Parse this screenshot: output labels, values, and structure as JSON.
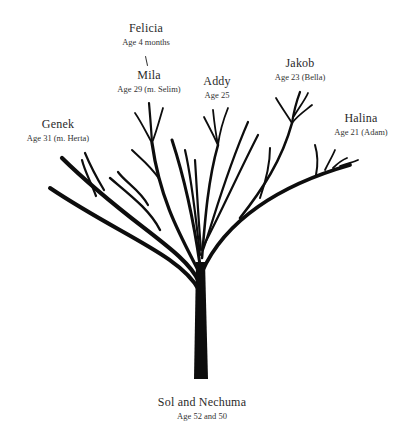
{
  "diagram": {
    "type": "family-tree",
    "trunk_color": "#0d0d0d",
    "background": "#ffffff",
    "root": {
      "name": "Sol and Nechuma",
      "age": "Age 52 and 50"
    },
    "children": [
      {
        "name": "Genek",
        "age": "Age 31 (m. Herta)"
      },
      {
        "name": "Mila",
        "age": "Age 29 (m. Selim)",
        "children": [
          {
            "name": "Felicia",
            "age": "Age 4 months"
          }
        ]
      },
      {
        "name": "Addy",
        "age": "Age 25"
      },
      {
        "name": "Jakob",
        "age": "Age 23 (Bella)"
      },
      {
        "name": "Halina",
        "age": "Age 21 (Adam)"
      }
    ]
  },
  "labels": {
    "felicia": {
      "name": "Felicia",
      "age": "Age 4 months"
    },
    "mila": {
      "name": "Mila",
      "age": "Age 29 (m. Selim)"
    },
    "genek": {
      "name": "Genek",
      "age": "Age 31 (m. Herta)"
    },
    "addy": {
      "name": "Addy",
      "age": "Age 25"
    },
    "jakob": {
      "name": "Jakob",
      "age": "Age 23 (Bella)"
    },
    "halina": {
      "name": "Halina",
      "age": "Age 21 (Adam)"
    },
    "root": {
      "name": "Sol and Nechuma",
      "age": "Age 52 and 50"
    }
  }
}
